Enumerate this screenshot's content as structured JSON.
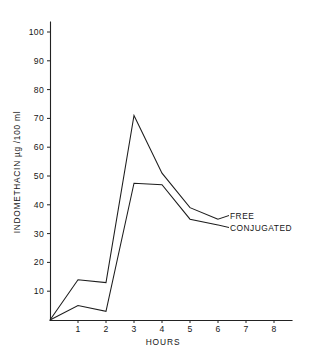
{
  "chart_data": {
    "type": "line",
    "title": "",
    "xlabel": "HOURS",
    "ylabel": "INDOMETHACIN µg /100 ml",
    "x": [
      0,
      1,
      2,
      3,
      4,
      5,
      6
    ],
    "xlim": [
      0,
      8
    ],
    "ylim": [
      0,
      100
    ],
    "xticks": [
      "1",
      "2",
      "3",
      "4",
      "5",
      "6",
      "7",
      "8"
    ],
    "yticks": [
      "10",
      "20",
      "30",
      "40",
      "50",
      "60",
      "70",
      "80",
      "90",
      "100"
    ],
    "grid": false,
    "legend_position": "right-inline-end-of-line",
    "series": [
      {
        "name": "FREE",
        "values": [
          0,
          14,
          13,
          71,
          51,
          39,
          35
        ]
      },
      {
        "name": "CONJUGATED",
        "values": [
          0,
          5,
          3,
          47.5,
          47,
          35,
          33
        ]
      }
    ]
  },
  "axes": {
    "y_title": "INDOMETHACIN µg /100 ml",
    "x_title": "HOURS",
    "y_labels": [
      "100",
      "90",
      "80",
      "70",
      "60",
      "50",
      "40",
      "30",
      "20",
      "10"
    ],
    "x_labels": [
      "1",
      "2",
      "3",
      "4",
      "5",
      "6",
      "7",
      "8"
    ]
  },
  "labels": {
    "free": "FREE",
    "conjugated": "CONJUGATED"
  },
  "colors": {
    "line": "#1d1d1d",
    "axis": "#222222",
    "background": "#ffffff",
    "text": "#161616"
  }
}
